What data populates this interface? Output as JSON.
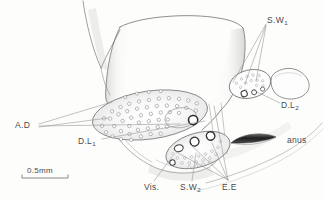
{
  "figure": {
    "type": "scientific-line-drawing",
    "technique": "pencil line drawing with stipple shading",
    "background_color": "#fdfdfc",
    "ink_color": "#555555"
  },
  "scale_bar": {
    "label": "0.5mm",
    "length_px": 46,
    "x": 22,
    "y": 177
  },
  "labels": [
    {
      "id": "sw1",
      "text": "S.W",
      "sub": "1",
      "x": 267,
      "y": 16,
      "leader_count": 3
    },
    {
      "id": "dl2",
      "text": "D.L",
      "sub": "2",
      "x": 281,
      "y": 101,
      "leader_count": 1
    },
    {
      "id": "ad",
      "text": "A.D",
      "sub": "",
      "x": 15,
      "y": 121,
      "leader_count": 3
    },
    {
      "id": "dl1",
      "text": "D.L",
      "sub": "1",
      "x": 78,
      "y": 137,
      "leader_count": 1
    },
    {
      "id": "vis",
      "text": "Vis.",
      "sub": "",
      "x": 144,
      "y": 183,
      "leader_count": 1
    },
    {
      "id": "sw2",
      "text": "S.W",
      "sub": "2",
      "x": 180,
      "y": 183,
      "leader_count": 1
    },
    {
      "id": "ee",
      "text": "E.E",
      "sub": "",
      "x": 222,
      "y": 183,
      "leader_count": 4
    },
    {
      "id": "anus",
      "text": "anus",
      "sub": "",
      "x": 287,
      "y": 136,
      "leader_count": 0
    }
  ],
  "structures": {
    "ad_plate": {
      "name": "A.D plate",
      "description": "large stippled oval field with numerous small pores and one large dark pore",
      "center": [
        150,
        115
      ],
      "rx": 58,
      "ry": 24,
      "rotation_deg": -8,
      "small_pore_count": 52,
      "large_pore": {
        "x": 188,
        "y": 123,
        "r": 4.6
      }
    },
    "sw1_plate": {
      "name": "S.W1 plate",
      "description": "small stippled oval with fine pores and three ring openings",
      "center": [
        250,
        84
      ],
      "rx": 20,
      "ry": 14,
      "rotation_deg": -14,
      "ring_count": 3
    },
    "dl2_lobe": {
      "name": "D.L2 lobe",
      "description": "leaf-shaped outlined lobe right of S.W1 plate",
      "center": [
        287,
        84
      ]
    },
    "sw2_plate": {
      "name": "S.W2 plate",
      "description": "lower stippled oval with three large ring openings and dense stipple field",
      "center": [
        198,
        150
      ],
      "rx": 32,
      "ry": 17,
      "rotation_deg": -16,
      "ring_count": 4
    },
    "anus": {
      "name": "anus",
      "description": "dark crescent / lens-shaped aperture",
      "center": [
        253,
        140
      ],
      "width": 44,
      "height": 7
    },
    "body_outline": {
      "name": "abdominal body outline",
      "description": "large rounded segment occupying upper-centre of plate"
    }
  }
}
